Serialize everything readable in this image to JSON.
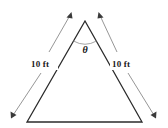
{
  "figure": {
    "type": "geometry-diagram",
    "shape": "isosceles-triangle",
    "background_color": "#ffffff",
    "edge_color": "#2b2b2b",
    "dimension_line_color": "#8a8a8a",
    "text_color": "#1a1a1a",
    "labels": {
      "left_side": "10 ft",
      "right_side": "10 ft",
      "apex_angle": "θ"
    },
    "measurements": [
      {
        "name": "left-leg",
        "value": 10,
        "unit": "ft",
        "text": "10 ft"
      },
      {
        "name": "right-leg",
        "value": 10,
        "unit": "ft",
        "text": "10 ft"
      }
    ],
    "angle": {
      "name": "apex-angle",
      "symbol": "θ",
      "vertex": "apex"
    },
    "vertices": {
      "apex": {
        "x": 85,
        "y": 21
      },
      "base_left": {
        "x": 27,
        "y": 122
      },
      "base_right": {
        "x": 142,
        "y": 122
      }
    }
  }
}
